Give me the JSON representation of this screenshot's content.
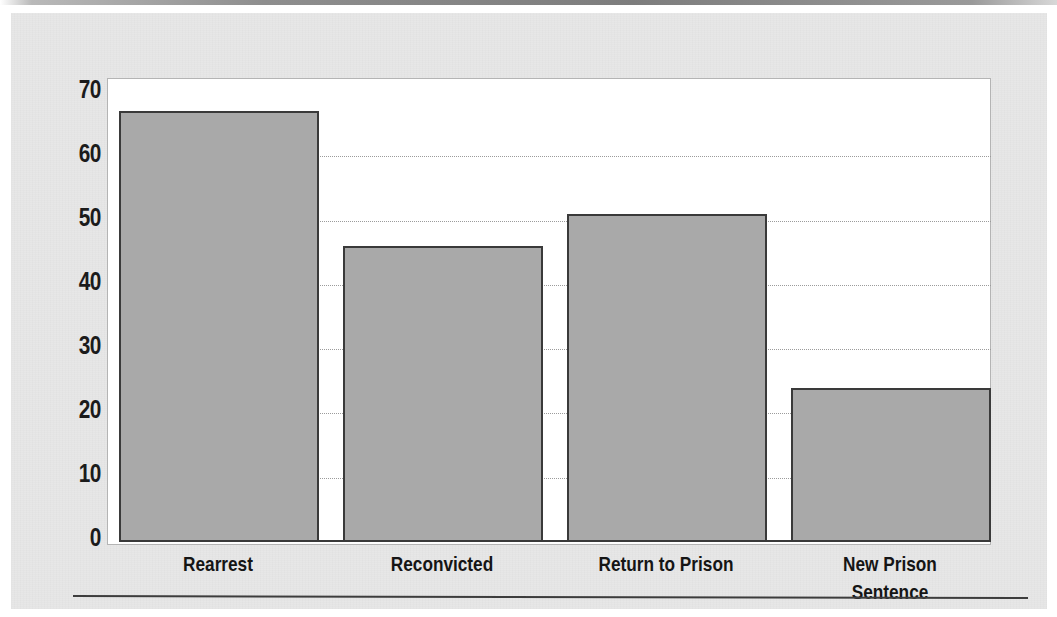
{
  "page": {
    "background_color": "#e7e7e7",
    "top_band_color": "#8e8e8e",
    "rule_color": "#3d3d3d"
  },
  "chart_data": {
    "type": "bar",
    "title": "",
    "subtitle": "",
    "xlabel": "",
    "ylabel": "",
    "categories": [
      "Rearrest",
      "Reconvicted",
      "Return to Prison",
      "New Prison Sentence"
    ],
    "values": [
      67,
      46,
      51,
      24
    ],
    "series": [
      {
        "name": "Percent",
        "values": [
          67,
          46,
          51,
          24
        ]
      }
    ],
    "ylim": [
      0,
      70
    ],
    "ytick_labels": [
      "70",
      "60",
      "50",
      "40",
      "30",
      "20",
      "10",
      "0"
    ],
    "ytick_values": [
      70,
      60,
      50,
      40,
      30,
      20,
      10,
      0
    ],
    "ytick_interval": 10,
    "grid": true,
    "grid_axis": "y",
    "grid_style": "dotted",
    "grid_color": "#9b9b9b",
    "legend": false,
    "legend_position": "none",
    "bar_fill_color": "#a9a9a9",
    "bar_border_color": "#3a3a3a",
    "plot_background_color": "#ffffff",
    "plot_border_color": "#b4b4b4",
    "annotations": []
  }
}
